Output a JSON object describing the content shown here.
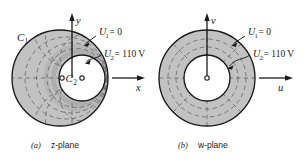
{
  "figure": {
    "background_color": "#ffffff",
    "shading_color": "#c2c2c2",
    "shading_color_dark": "#b0b0b0",
    "stroke_color": "#1a1a1a",
    "dash_color": "#6e6e6e",
    "inner_fill": "#ffffff"
  },
  "panel_a": {
    "caption_tag": "(a)",
    "caption_text": "z-plane",
    "axis_x_label": "x",
    "axis_y_label": "y",
    "outer_boundary_label": "C",
    "outer_boundary_sub": "1",
    "inner_boundary_label": "C",
    "inner_boundary_sub": "2",
    "annotation_1": {
      "symbol": "U",
      "sub": "1",
      "equals": "= 0",
      "full": "U1 = 0"
    },
    "annotation_2": {
      "symbol": "U",
      "sub": "2",
      "equals": "= 110 V",
      "full": "U2 = 110 V"
    },
    "geometry": {
      "outer_circle": {
        "cx": 60,
        "cy": 78,
        "r": 48
      },
      "inner_circle": {
        "cx": 82,
        "cy": 78,
        "r": 23
      },
      "origin_marker": {
        "cx": 62,
        "cy": 78,
        "r": 2.1
      },
      "inner_center_marker": {
        "cx": 82,
        "cy": 78,
        "r": 2.1
      },
      "equipotential_arcs": 3,
      "flux_lines": 8
    }
  },
  "panel_b": {
    "caption_tag": "(b)",
    "caption_text": "w-plane",
    "axis_x_label": "u",
    "axis_y_label": "v",
    "origin_marker_label": "o",
    "annotation_1": {
      "symbol": "U",
      "sub": "1",
      "equals": "= 0",
      "full": "U1 = 0"
    },
    "annotation_2": {
      "symbol": "U",
      "sub": "2",
      "equals": "= 110 V",
      "full": "U2 = 110 V"
    },
    "geometry": {
      "outer_circle": {
        "cx": 207,
        "cy": 78,
        "r": 48
      },
      "inner_circle": {
        "cx": 207,
        "cy": 78,
        "r": 23
      },
      "origin_marker": {
        "cx": 207,
        "cy": 78,
        "r": 2.1
      },
      "equipotential_radii": [
        31,
        39
      ],
      "flux_lines": 8
    }
  },
  "icons": {
    "arrow_head": "arrow-head-icon",
    "leader_line": "leader-line-icon"
  }
}
